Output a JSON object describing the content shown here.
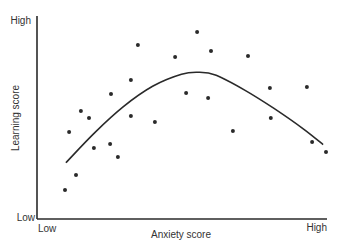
{
  "chart_data": {
    "type": "scatter",
    "title": "",
    "xlabel": "Anxiety score",
    "ylabel": "Learning score",
    "x_ticks": [
      "Low",
      "High"
    ],
    "y_ticks": [
      "Low",
      "High"
    ],
    "xlim": [
      0,
      100
    ],
    "ylim": [
      0,
      100
    ],
    "grid": false,
    "legend": null,
    "series": [
      {
        "name": "Observations",
        "kind": "scatter",
        "points": [
          {
            "x": 9.7,
            "y": 14.4
          },
          {
            "x": 13.5,
            "y": 21.9
          },
          {
            "x": 11.1,
            "y": 43.3
          },
          {
            "x": 15.2,
            "y": 53.7
          },
          {
            "x": 18.0,
            "y": 50.2
          },
          {
            "x": 19.7,
            "y": 35.3
          },
          {
            "x": 25.6,
            "y": 62.2
          },
          {
            "x": 28.0,
            "y": 30.8
          },
          {
            "x": 25.3,
            "y": 37.3
          },
          {
            "x": 32.5,
            "y": 51.2
          },
          {
            "x": 34.9,
            "y": 86.6
          },
          {
            "x": 40.8,
            "y": 48.3
          },
          {
            "x": 32.5,
            "y": 69.2
          },
          {
            "x": 47.8,
            "y": 80.6
          },
          {
            "x": 51.6,
            "y": 62.7
          },
          {
            "x": 55.4,
            "y": 93.0
          },
          {
            "x": 59.2,
            "y": 60.2
          },
          {
            "x": 60.2,
            "y": 83.6
          },
          {
            "x": 67.8,
            "y": 43.8
          },
          {
            "x": 73.0,
            "y": 81.1
          },
          {
            "x": 80.6,
            "y": 65.2
          },
          {
            "x": 80.9,
            "y": 50.2
          },
          {
            "x": 93.4,
            "y": 65.7
          },
          {
            "x": 95.2,
            "y": 38.3
          },
          {
            "x": 100.0,
            "y": 33.3
          }
        ]
      },
      {
        "name": "Inverted-U trend",
        "kind": "curve",
        "points": [
          {
            "x": 10.0,
            "y": 28.0
          },
          {
            "x": 20.0,
            "y": 43.0
          },
          {
            "x": 30.0,
            "y": 56.0
          },
          {
            "x": 40.0,
            "y": 66.0
          },
          {
            "x": 50.0,
            "y": 72.0
          },
          {
            "x": 56.0,
            "y": 73.0
          },
          {
            "x": 62.0,
            "y": 71.5
          },
          {
            "x": 72.0,
            "y": 64.0
          },
          {
            "x": 82.0,
            "y": 55.0
          },
          {
            "x": 92.0,
            "y": 45.0
          },
          {
            "x": 99.0,
            "y": 37.0
          }
        ]
      }
    ]
  },
  "axes": {
    "y_high_label": "High",
    "y_low_label": "Low",
    "x_low_label": "Low",
    "x_high_label": "High",
    "x_title": "Anxiety score",
    "y_title": "Learning score"
  },
  "colors": {
    "ink": "#2a2a2a",
    "background": "#ffffff"
  }
}
